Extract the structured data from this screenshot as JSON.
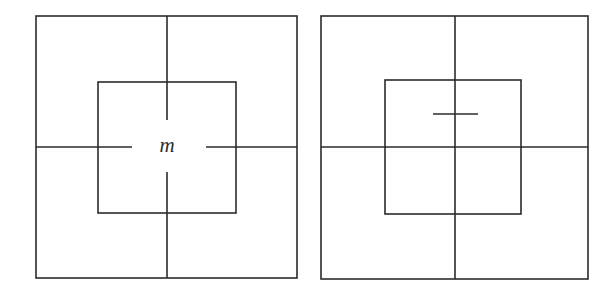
{
  "figure": {
    "background_color": "#ffffff",
    "stroke_color": "#2b2b2b",
    "stroke_width": 1.6,
    "width": 613,
    "height": 293
  },
  "panels": [
    {
      "id": "left-panel",
      "name": "left-diagram",
      "description": "Outer square with a smaller centered inner square; four short cross arms run inward from the outer sides and stop short of the centre, leaving a gap around the label.",
      "outer_square": {
        "x": 36,
        "y": 16,
        "width": 261,
        "height": 262
      },
      "inner_square": {
        "x": 98,
        "y": 82,
        "width": 138,
        "height": 131
      },
      "center": {
        "x": 167,
        "y": 147
      },
      "cross_segments": [
        {
          "name": "cross-arm-top",
          "x1": 167,
          "y1": 16,
          "x2": 167,
          "y2": 120
        },
        {
          "name": "cross-arm-bottom",
          "x1": 167,
          "y1": 172,
          "x2": 167,
          "y2": 278
        },
        {
          "name": "cross-arm-left",
          "x1": 36,
          "y1": 147,
          "x2": 132,
          "y2": 147
        },
        {
          "name": "cross-arm-right",
          "x1": 206,
          "y1": 147,
          "x2": 297,
          "y2": 147
        }
      ],
      "label": {
        "text": "m",
        "x": 167,
        "y": 152,
        "font_size": 21,
        "style": "italic"
      }
    },
    {
      "id": "right-panel",
      "name": "right-diagram",
      "description": "Outer square with full horizontal and vertical centre lines; the inner square is offset up and to the left so the centre lines pass through its lower-right region. A short horizontal tick crosses the vertical centre line above the middle.",
      "outer_square": {
        "x": 321,
        "y": 16,
        "width": 267,
        "height": 263
      },
      "inner_square": {
        "x": 385,
        "y": 80,
        "width": 136,
        "height": 134
      },
      "center": {
        "x": 455,
        "y": 147
      },
      "cross_segments": [
        {
          "name": "cross-line-vertical",
          "x1": 455,
          "y1": 16,
          "x2": 455,
          "y2": 279
        },
        {
          "name": "cross-line-horizontal",
          "x1": 321,
          "y1": 147,
          "x2": 588,
          "y2": 147
        }
      ],
      "tick_mark": {
        "name": "horizontal-tick-mark",
        "x1": 433,
        "y1": 114,
        "x2": 478,
        "y2": 114
      },
      "label": null
    }
  ]
}
